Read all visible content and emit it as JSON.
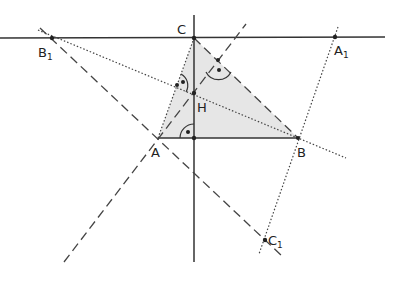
{
  "diagram": {
    "type": "geometry-triangle-orthocenter",
    "colors": {
      "stroke": "#333333",
      "fill": "#e6e6e6",
      "background": "#ffffff"
    },
    "points": {
      "A": {
        "label": "A",
        "x": 158,
        "y": 138
      },
      "B": {
        "label": "B",
        "x": 298,
        "y": 138
      },
      "C": {
        "label": "C",
        "x": 194,
        "y": 38
      },
      "H": {
        "label": "H",
        "x": 194,
        "y": 93
      },
      "A1": {
        "label": "A",
        "sub": "1",
        "x": 335,
        "y": 37
      },
      "B1": {
        "label": "B",
        "sub": "1",
        "x": 52,
        "y": 38
      },
      "C1": {
        "label": "C",
        "sub": "1",
        "x": 265,
        "y": 240
      }
    },
    "labels": {
      "A": "A",
      "B": "B",
      "C": "C",
      "H": "H",
      "A1": "A",
      "A1_sub": "1",
      "B1": "B",
      "B1_sub": "1",
      "C1": "C",
      "C1_sub": "1"
    }
  }
}
